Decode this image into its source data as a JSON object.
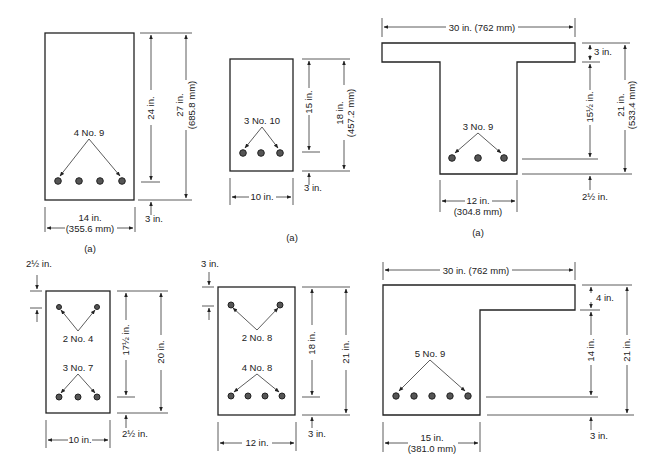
{
  "sections": [
    {
      "id": "rect-beam-1",
      "shape": "rectangle",
      "caption": "(a)",
      "reinforcement": {
        "bottom": "4 No. 9"
      },
      "dimensions": {
        "width": "14 in.",
        "width_mm": "(355.6 mm)",
        "effective_depth": "24 in.",
        "total_depth": "27 in.",
        "total_depth_mm": "(685.8 mm)",
        "cover_bottom": "3 in."
      }
    },
    {
      "id": "rect-beam-2",
      "shape": "rectangle",
      "caption": "(a)",
      "reinforcement": {
        "bottom": "3 No. 10"
      },
      "dimensions": {
        "width": "10 in.",
        "effective_depth": "15 in.",
        "total_depth": "18 in.",
        "total_depth_mm": "(457.2 mm)",
        "cover_bottom": "3 in."
      }
    },
    {
      "id": "t-beam",
      "shape": "T-section",
      "caption": "(a)",
      "reinforcement": {
        "bottom": "3 No. 9"
      },
      "dimensions": {
        "flange_width": "30 in. (762 mm)",
        "flange_thickness": "3 in.",
        "web_depth_to_steel": "15½ in.",
        "total_depth": "21 in.",
        "total_depth_mm": "(533.4 mm)",
        "web_width": "12 in.",
        "web_width_mm": "(304.8 mm)",
        "cover_bottom": "2½ in."
      }
    },
    {
      "id": "doubly-reinforced-1",
      "shape": "rectangle",
      "reinforcement": {
        "top": "2 No. 4",
        "bottom": "3 No. 7"
      },
      "dimensions": {
        "width": "10 in.",
        "effective_depth": "17½ in.",
        "total_depth": "20 in.",
        "cover_top": "2½ in.",
        "cover_bottom": "2½ in."
      }
    },
    {
      "id": "doubly-reinforced-2",
      "shape": "rectangle",
      "reinforcement": {
        "top": "2 No. 8",
        "bottom": "4 No. 8"
      },
      "dimensions": {
        "width": "12 in.",
        "effective_depth": "18 in.",
        "total_depth": "21 in.",
        "cover_top": "3 in.",
        "cover_bottom": "3 in."
      }
    },
    {
      "id": "l-beam",
      "shape": "L-section",
      "reinforcement": {
        "bottom": "5 No. 9"
      },
      "dimensions": {
        "flange_width": "30 in. (762 mm)",
        "flange_thickness": "4 in.",
        "web_depth_to_steel": "14 in.",
        "total_depth": "21 in.",
        "web_width": "15 in.",
        "web_width_mm": "(381.0 mm)",
        "cover_bottom": "3 in."
      }
    }
  ]
}
